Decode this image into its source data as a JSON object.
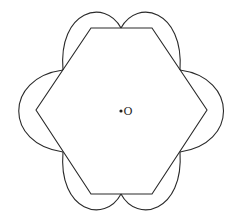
{
  "diagram": {
    "center": {
      "label": "O",
      "x": 121,
      "y": 111
    },
    "hexagon": {
      "vertices": [
        [
          91,
          28
        ],
        [
          152,
          28
        ],
        [
          207,
          110
        ],
        [
          152,
          194
        ],
        [
          91,
          194
        ],
        [
          36,
          110
        ]
      ]
    },
    "petals": [
      {
        "name": "top-left",
        "from": [
          63,
          70
        ],
        "to": [
          121,
          28
        ],
        "ctrl1": [
          58,
          10
        ],
        "ctrl2": [
          105,
          -2
        ]
      },
      {
        "name": "top-right",
        "from": [
          121,
          28
        ],
        "to": [
          180,
          70
        ],
        "ctrl1": [
          137,
          -2
        ],
        "ctrl2": [
          184,
          10
        ]
      },
      {
        "name": "right",
        "from": [
          180,
          70
        ],
        "to": [
          180,
          152
        ],
        "ctrl1": [
          238,
          78
        ],
        "ctrl2": [
          238,
          144
        ]
      },
      {
        "name": "bottom-right",
        "from": [
          180,
          152
        ],
        "to": [
          121,
          194
        ],
        "ctrl1": [
          184,
          212
        ],
        "ctrl2": [
          137,
          224
        ]
      },
      {
        "name": "bottom-left",
        "from": [
          121,
          194
        ],
        "to": [
          63,
          152
        ],
        "ctrl1": [
          105,
          224
        ],
        "ctrl2": [
          58,
          212
        ]
      },
      {
        "name": "left",
        "from": [
          63,
          152
        ],
        "to": [
          63,
          70
        ],
        "ctrl1": [
          4,
          144
        ],
        "ctrl2": [
          4,
          78
        ]
      }
    ],
    "colors": {
      "stroke": "#2a2a2a",
      "background": "#ffffff"
    }
  }
}
